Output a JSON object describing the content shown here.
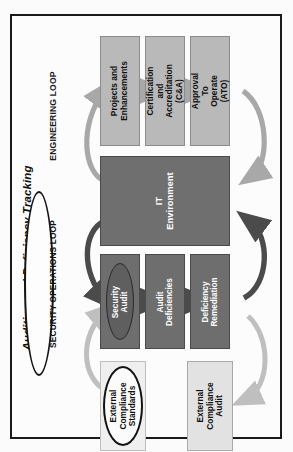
{
  "diagram": {
    "title": "Auditing and Deficiency Tracking Process",
    "orientation": "rotated-90-ccw",
    "loops": [
      {
        "id": "engineering-loop",
        "label": "ENGINEERING LOOP",
        "style": "plain-text"
      },
      {
        "id": "security-operations-loop",
        "label": "SECURITY OPERATIONS LOOP",
        "style": "ellipse-outline"
      }
    ],
    "nodes": [
      {
        "id": "projects-and-enhancements",
        "label": "Projects and\nEnhancements",
        "shape": "rectangle",
        "fill": "#b9b9b9",
        "text_color": "#101010"
      },
      {
        "id": "certification-and-accreditation",
        "label": "Certification and\nAccreditation\n(C&A)",
        "shape": "rectangle",
        "fill": "#b9b9b9",
        "text_color": "#101010"
      },
      {
        "id": "approval-to-operate",
        "label": "Approval To\nOperate (ATO)",
        "shape": "rectangle",
        "fill": "#b9b9b9",
        "text_color": "#101010"
      },
      {
        "id": "it-environment",
        "label": "IT\nEnvironment",
        "shape": "rectangle",
        "fill": "#6f6f6f",
        "text_color": "#ffffff"
      },
      {
        "id": "security-audit",
        "label": "Security\nAudit",
        "shape": "ellipse-on-rectangle",
        "fill": "#5f5f5f",
        "text_color": "#ffffff"
      },
      {
        "id": "audit-deficiencies",
        "label": "Audit\nDeficiencies",
        "shape": "rectangle",
        "fill": "#6e6e6e",
        "text_color": "#ffffff"
      },
      {
        "id": "deficiency-remediation",
        "label": "Deficiency\nRemediation",
        "shape": "rectangle",
        "fill": "#6e6e6e",
        "text_color": "#ffffff"
      },
      {
        "id": "external-compliance-standards",
        "label": "External\nCompliance\nStandards",
        "shape": "ellipse",
        "fill": "#fbfbfb",
        "text_color": "#101010"
      },
      {
        "id": "external-compliance-audit",
        "label": "External\nCompliance\nAudit",
        "shape": "rectangle",
        "fill": "#e2e2e2",
        "text_color": "#101010"
      }
    ],
    "connectors": [
      {
        "id": "it-environment-to-projects",
        "from": "it-environment",
        "to": "projects-and-enhancements",
        "kind": "curved-arrow",
        "color": "#a8a8a8"
      },
      {
        "id": "projects-to-certification",
        "from": "projects-and-enhancements",
        "to": "certification-and-accreditation",
        "kind": "straight-arrow",
        "color": "#a8a8a8"
      },
      {
        "id": "certification-to-approval",
        "from": "certification-and-accreditation",
        "to": "approval-to-operate",
        "kind": "straight-arrow",
        "color": "#a8a8a8"
      },
      {
        "id": "approval-to-it-environment",
        "from": "approval-to-operate",
        "to": "it-environment",
        "kind": "curved-arrow",
        "color": "#a8a8a8"
      },
      {
        "id": "it-environment-to-security-audit",
        "from": "it-environment",
        "to": "security-audit",
        "kind": "curved-arrow",
        "color": "#4b4b4b"
      },
      {
        "id": "security-audit-to-audit-deficiencies",
        "from": "security-audit",
        "to": "audit-deficiencies",
        "kind": "straight-arrow",
        "color": "#4b4b4b"
      },
      {
        "id": "audit-deficiencies-to-remediation",
        "from": "audit-deficiencies",
        "to": "deficiency-remediation",
        "kind": "straight-arrow",
        "color": "#4b4b4b"
      },
      {
        "id": "remediation-to-it-environment",
        "from": "deficiency-remediation",
        "to": "it-environment",
        "kind": "curved-arrow",
        "color": "#4b4b4b"
      },
      {
        "id": "standards-to-security-audit",
        "from": "external-compliance-standards",
        "to": "security-audit",
        "kind": "curved-arrow",
        "color": "#b5b5b5"
      },
      {
        "id": "remediation-to-external-audit",
        "from": "deficiency-remediation",
        "to": "external-compliance-audit",
        "kind": "curved-arrow",
        "color": "#c2c2c2"
      }
    ]
  }
}
